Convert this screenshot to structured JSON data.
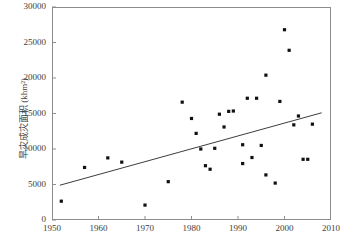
{
  "chart_data": {
    "type": "scatter",
    "title": "",
    "xlabel": "",
    "ylabel": "旱灾成灾面积 (khm²)",
    "ylabel_plain": "旱灾成灾面积 (khm2)",
    "xlim": [
      1950,
      2010
    ],
    "ylim": [
      0,
      30000
    ],
    "xticks": [
      1950,
      1960,
      1970,
      1980,
      1990,
      2000,
      2010
    ],
    "yticks": [
      0,
      5000,
      10000,
      15000,
      20000,
      25000,
      30000
    ],
    "xtick_labels": [
      "1950",
      "1960",
      "1970",
      "1980",
      "1990",
      "2000",
      "2010"
    ],
    "ytick_labels": [
      "0",
      "5000",
      "10000",
      "15000",
      "20000",
      "25000",
      "30000"
    ],
    "grid": false,
    "legend": false,
    "marker": "filled-square",
    "marker_color": "#111111",
    "series": [
      {
        "name": "旱灾成灾面积",
        "points": [
          [
            1952,
            2650
          ],
          [
            1957,
            7400
          ],
          [
            1962,
            8750
          ],
          [
            1965,
            8150
          ],
          [
            1970,
            2100
          ],
          [
            1975,
            5400
          ],
          [
            1978,
            16600
          ],
          [
            1980,
            14300
          ],
          [
            1981,
            12200
          ],
          [
            1982,
            10000
          ],
          [
            1983,
            7650
          ],
          [
            1984,
            7150
          ],
          [
            1985,
            10100
          ],
          [
            1986,
            14900
          ],
          [
            1987,
            13100
          ],
          [
            1988,
            15300
          ],
          [
            1989,
            15350
          ],
          [
            1991,
            10600
          ],
          [
            1991,
            7950
          ],
          [
            1992,
            17150
          ],
          [
            1993,
            8800
          ],
          [
            1994,
            17150
          ],
          [
            1995,
            10500
          ],
          [
            1996,
            6350
          ],
          [
            1996,
            20400
          ],
          [
            1998,
            5200
          ],
          [
            1999,
            16700
          ],
          [
            2000,
            26800
          ],
          [
            2001,
            23900
          ],
          [
            2002,
            13400
          ],
          [
            2003,
            14650
          ],
          [
            2004,
            8550
          ],
          [
            2005,
            8550
          ],
          [
            2006,
            13500
          ]
        ]
      }
    ],
    "trendline": {
      "type": "linear",
      "x_start": 1951.7,
      "y_start": 4900,
      "x_end": 2008.0,
      "y_end": 15100,
      "color": "#3d3d3d"
    }
  }
}
